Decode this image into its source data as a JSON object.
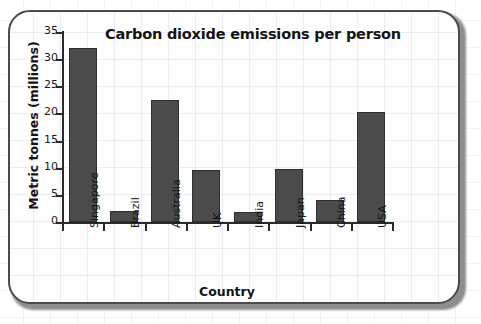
{
  "chart_data": {
    "type": "bar",
    "title": "Carbon dioxide emissions per person",
    "xlabel": "Country",
    "ylabel": "Metric tonnes (millions)",
    "categories": [
      "Singapore",
      "Brazil",
      "Australia",
      "UK",
      "India",
      "Japan",
      "China",
      "USA"
    ],
    "values": [
      32.0,
      2.0,
      22.5,
      9.6,
      1.8,
      9.7,
      4.1,
      20.2
    ],
    "ylim": [
      0,
      35
    ],
    "ytick_labels": [
      "0",
      "5",
      "10",
      "15",
      "20",
      "25",
      "30",
      "35"
    ],
    "ytick_values": [
      0,
      5,
      10,
      15,
      20,
      25,
      30,
      35
    ],
    "grid": "faint background graph paper",
    "legend": "none",
    "bar_color": "#4b4b4b",
    "bar_border_color": "#2e2e2e",
    "axis_color": "#2a2a2a",
    "text_color": "#141414",
    "card_border_color": "#4a4a4a",
    "card_background": "#fdfdfd"
  }
}
